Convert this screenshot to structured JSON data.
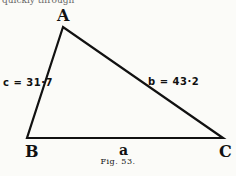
{
  "top_text_fragment": "quickly through",
  "triangle": {
    "vertices": {
      "A": {
        "label": "A",
        "x": 63,
        "y": 27
      },
      "B": {
        "label": "B",
        "x": 27,
        "y": 138
      },
      "C": {
        "label": "C",
        "x": 223,
        "y": 138
      }
    },
    "sides": {
      "a": {
        "label": "a"
      },
      "b": {
        "label": "b = 43·2"
      },
      "c": {
        "label": "c = 31·7"
      }
    }
  },
  "caption": "Fig. 53."
}
